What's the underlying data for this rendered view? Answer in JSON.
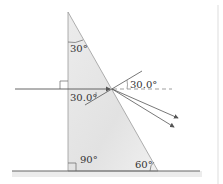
{
  "diagram": {
    "type": "prism refraction",
    "labels": {
      "apex_angle": "30°",
      "incident_angle": "30.0°",
      "normal_angle": "30.0°",
      "right_angle": "90°",
      "base_angle": "60°"
    },
    "colors": {
      "prism_fill": "#e6e6e6",
      "prism_edge": "#9a9a9a",
      "ray": "#555555",
      "ground": "#666666",
      "text": "#333333"
    }
  }
}
